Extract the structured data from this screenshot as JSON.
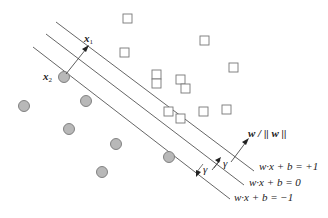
{
  "diagram": {
    "colors": {
      "line": "#555555",
      "square_stroke": "#777777",
      "circle_fill": "#b8b8b8",
      "circle_stroke": "#777777",
      "text": "#222222"
    },
    "labels": {
      "x1": "x",
      "x1_sub": "1",
      "x2": "x",
      "x2_sub": "2",
      "normal": "w / || w ||",
      "gamma": "γ",
      "plus_plane": "w·x + b = +1",
      "zero_plane": "w·x + b = 0",
      "minus_plane": "w·x + b = −1"
    },
    "squares": [
      [
        127,
        20
      ],
      [
        205,
        40
      ],
      [
        123,
        52
      ],
      [
        155,
        73
      ],
      [
        176,
        90
      ],
      [
        152,
        107
      ],
      [
        183,
        117
      ]
    ],
    "circles": [
      [
        70,
        75
      ],
      [
        23,
        105
      ],
      [
        86,
        129
      ],
      [
        69,
        128
      ],
      [
        116,
        142
      ],
      [
        101,
        172
      ],
      [
        170,
        159
      ]
    ]
  }
}
